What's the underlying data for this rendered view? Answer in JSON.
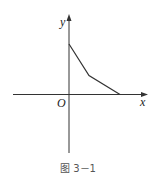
{
  "figure": {
    "caption": "图 3－1",
    "axes": {
      "x_label": "x",
      "y_label": "y",
      "origin_label": "O"
    },
    "line_color": "#333333",
    "polyline_points": [
      [
        0,
        3
      ],
      [
        1,
        1.2
      ],
      [
        3,
        0
      ]
    ]
  }
}
